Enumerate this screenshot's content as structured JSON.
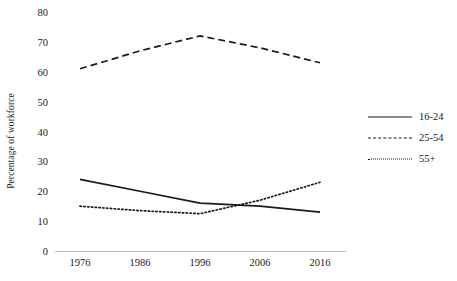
{
  "chart_data": {
    "type": "line",
    "title": "",
    "xlabel": "",
    "ylabel": "Percentage of workforce",
    "x": [
      1976,
      1986,
      1996,
      2006,
      2016
    ],
    "xtick_labels": [
      "1976",
      "1986",
      "1996",
      "2006",
      "2016"
    ],
    "ytick_labels": [
      "0",
      "10",
      "20",
      "30",
      "40",
      "50",
      "60",
      "70",
      "80"
    ],
    "ytick_values": [
      0,
      10,
      20,
      30,
      40,
      50,
      60,
      70,
      80
    ],
    "ylim": [
      0,
      80
    ],
    "grid": false,
    "legend_position": "right",
    "series": [
      {
        "name": "16-24",
        "style": "solid",
        "color": "#1a1a1a",
        "values": [
          24,
          20,
          16,
          15,
          13
        ]
      },
      {
        "name": "25-54",
        "style": "dashed",
        "color": "#1a1a1a",
        "values": [
          61,
          67,
          72,
          68,
          63
        ]
      },
      {
        "name": "55+",
        "style": "dotted",
        "color": "#1a1a1a",
        "values": [
          15,
          13.5,
          12.5,
          17,
          23
        ]
      }
    ]
  },
  "axis": {
    "y_title": "Percentage of workforce"
  },
  "legend": {
    "entries": [
      {
        "label": "16-24"
      },
      {
        "label": "25-54"
      },
      {
        "label": "55+"
      }
    ]
  },
  "colors": {
    "line": "#1a1a1a",
    "axis": "#bfbfbf",
    "background": "#ffffff"
  }
}
